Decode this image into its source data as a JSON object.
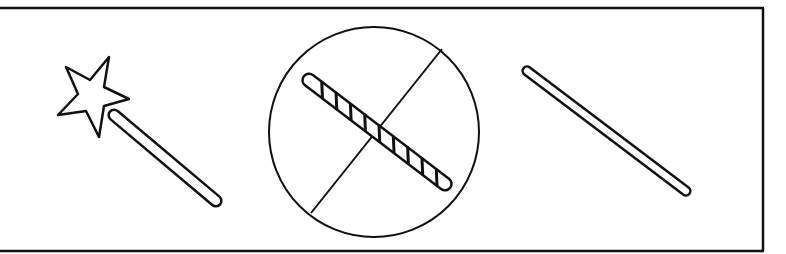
{
  "figure": {
    "panels": [
      {
        "id": "wand",
        "label": "magic-wand"
      },
      {
        "id": "striped-stick-prohibited",
        "label": "striped-stick-crossed-out"
      },
      {
        "id": "plain-stick",
        "label": "plain-stick"
      }
    ],
    "colors": {
      "stroke": "#111111",
      "fill": "#ffffff"
    }
  }
}
